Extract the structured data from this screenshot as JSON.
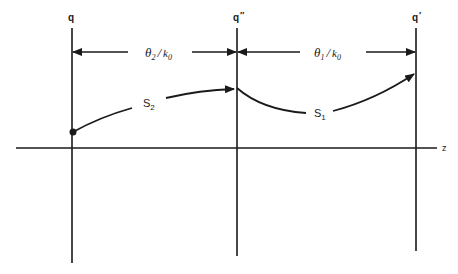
{
  "diagram": {
    "points": [
      {
        "id": "q",
        "label": "q",
        "prime": ""
      },
      {
        "id": "q2",
        "label": "q",
        "prime": "″"
      },
      {
        "id": "q1",
        "label": "q",
        "prime": "′"
      }
    ],
    "intervals": [
      {
        "id": "left",
        "numerator": "θ",
        "sub": "2",
        "slash": "/",
        "denom": "k",
        "denom_sub": "0"
      },
      {
        "id": "right",
        "numerator": "θ",
        "sub": "1",
        "slash": "/",
        "denom": "k",
        "denom_sub": "0"
      }
    ],
    "paths": [
      {
        "id": "s2",
        "label": "S",
        "sub": "2"
      },
      {
        "id": "s1",
        "label": "S",
        "sub": "1"
      }
    ],
    "axis": {
      "label": "z"
    }
  }
}
